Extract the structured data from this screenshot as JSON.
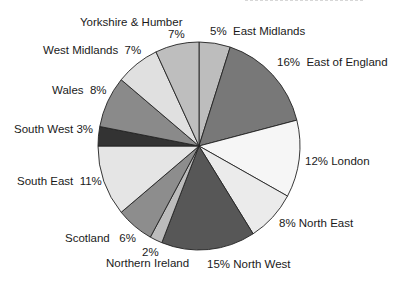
{
  "chart_data": {
    "type": "pie",
    "title": "",
    "start_angle_deg": 0,
    "direction": "clockwise",
    "center": [
      199,
      146
    ],
    "radius": [
      101,
      104
    ],
    "slices": [
      {
        "label": "East Midlands",
        "value": 5,
        "pct_text": "5%",
        "color": "#bdbdbd"
      },
      {
        "label": "East of England",
        "value": 16,
        "pct_text": "16%",
        "color": "#787878"
      },
      {
        "label": "London",
        "value": 12,
        "pct_text": "12%",
        "color": "#f6f6f6"
      },
      {
        "label": "North East",
        "value": 8,
        "pct_text": "8%",
        "color": "#ebebeb"
      },
      {
        "label": "North West",
        "value": 15,
        "pct_text": "15%",
        "color": "#575757"
      },
      {
        "label": "Northern Ireland",
        "value": 2,
        "pct_text": "2%",
        "color": "#bcbcbc"
      },
      {
        "label": "Scotland",
        "value": 6,
        "pct_text": "6%",
        "color": "#8d8d8d"
      },
      {
        "label": "South East",
        "value": 11,
        "pct_text": "11%",
        "color": "#e5e5e5"
      },
      {
        "label": "South West",
        "value": 3,
        "pct_text": "3%",
        "color": "#333333"
      },
      {
        "label": "Wales",
        "value": 8,
        "pct_text": "8%",
        "color": "#8a8a8a"
      },
      {
        "label": "West Midlands",
        "value": 7,
        "pct_text": "7%",
        "color": "#e0e0e0"
      },
      {
        "label": "Yorkshire & Humber",
        "value": 7,
        "pct_text": "7%",
        "color": "#bebebe"
      }
    ],
    "legend": "none (direct labels)"
  },
  "labels": {
    "yorkshire_name": "Yorkshire & Humber",
    "yorkshire_pct": "7%",
    "east_midlands": "5%  East Midlands",
    "east_of_england": "16%  East of England",
    "london": "12% London",
    "north_east": "8% North East",
    "north_west": "15% North West",
    "northern_ireland_pct": "2%",
    "northern_ireland_name": "Northern Ireland",
    "scotland": "Scotland   6%",
    "south_east": "South East  11%",
    "south_west": "South West 3%",
    "wales": "Wales  8%",
    "west_midlands": "West Midlands  7%"
  },
  "style": {
    "outline_color": "#222222"
  }
}
